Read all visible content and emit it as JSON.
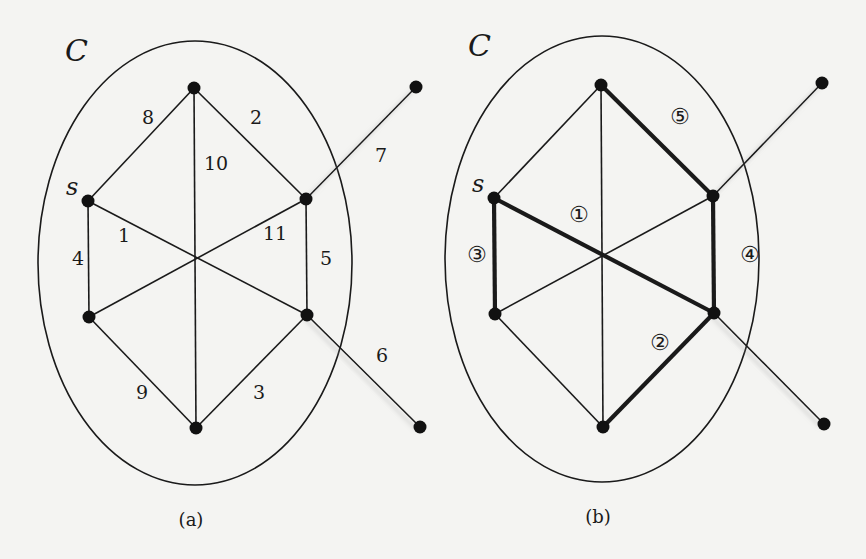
{
  "figure": {
    "panels": [
      {
        "id": "a",
        "caption": "(a)",
        "set_label": "C",
        "source_label": "s",
        "ellipse": {
          "cx": 195,
          "cy": 263,
          "rx": 157,
          "ry": 222
        },
        "nodes": {
          "top": [
            194,
            88
          ],
          "s": [
            88,
            201
          ],
          "ru": [
            306,
            199
          ],
          "ll": [
            89,
            317
          ],
          "rl": [
            307,
            315
          ],
          "bottom": [
            196,
            428
          ],
          "ext_top": [
            416,
            87
          ],
          "ext_bottom": [
            420,
            427
          ]
        },
        "edges": [
          {
            "from": "s",
            "to": "rl",
            "label": "1",
            "lx": 118,
            "ly": 242
          },
          {
            "from": "top",
            "to": "ru",
            "label": "2",
            "lx": 250,
            "ly": 124
          },
          {
            "from": "rl",
            "to": "bottom",
            "label": "3",
            "lx": 253,
            "ly": 399
          },
          {
            "from": "s",
            "to": "ll",
            "label": "4",
            "lx": 72,
            "ly": 265
          },
          {
            "from": "ru",
            "to": "rl",
            "label": "5",
            "lx": 320,
            "ly": 265
          },
          {
            "from": "rl",
            "to": "ext_bottom",
            "label": "6",
            "lx": 376,
            "ly": 362,
            "external": true
          },
          {
            "from": "ru",
            "to": "ext_top",
            "label": "7",
            "lx": 375,
            "ly": 162,
            "external": true
          },
          {
            "from": "s",
            "to": "top",
            "label": "8",
            "lx": 142,
            "ly": 124
          },
          {
            "from": "ll",
            "to": "bottom",
            "label": "9",
            "lx": 136,
            "ly": 399
          },
          {
            "from": "top",
            "to": "bottom",
            "label": "10",
            "lx": 204,
            "ly": 170
          },
          {
            "from": "ll",
            "to": "ru",
            "label": "11",
            "lx": 263,
            "ly": 240
          }
        ]
      },
      {
        "id": "b",
        "caption": "(b)",
        "set_label": "C",
        "source_label": "s",
        "ellipse": {
          "cx": 602,
          "cy": 259,
          "rx": 157,
          "ry": 223
        },
        "nodes": {
          "top": [
            601,
            85
          ],
          "s": [
            494,
            198
          ],
          "ru": [
            713,
            196
          ],
          "ll": [
            495,
            314
          ],
          "rl": [
            714,
            313
          ],
          "bottom": [
            603,
            427
          ],
          "ext_top": [
            822,
            83
          ],
          "ext_bottom": [
            824,
            424
          ]
        },
        "edges": [
          {
            "from": "s",
            "to": "rl",
            "order": "①",
            "bold": true,
            "lx": 569,
            "ly": 222
          },
          {
            "from": "rl",
            "to": "bottom",
            "order": "②",
            "bold": true,
            "lx": 650,
            "ly": 350
          },
          {
            "from": "s",
            "to": "ll",
            "order": "③",
            "bold": true,
            "lx": 467,
            "ly": 262
          },
          {
            "from": "ru",
            "to": "rl",
            "order": "④",
            "bold": true,
            "lx": 740,
            "ly": 262
          },
          {
            "from": "top",
            "to": "ru",
            "order": "⑤",
            "bold": true,
            "lx": 670,
            "ly": 124
          },
          {
            "from": "rl",
            "to": "ext_bottom",
            "external": true
          },
          {
            "from": "ru",
            "to": "ext_top",
            "external": true
          },
          {
            "from": "s",
            "to": "top"
          },
          {
            "from": "ll",
            "to": "bottom"
          },
          {
            "from": "top",
            "to": "bottom"
          },
          {
            "from": "ll",
            "to": "ru"
          }
        ]
      }
    ]
  }
}
